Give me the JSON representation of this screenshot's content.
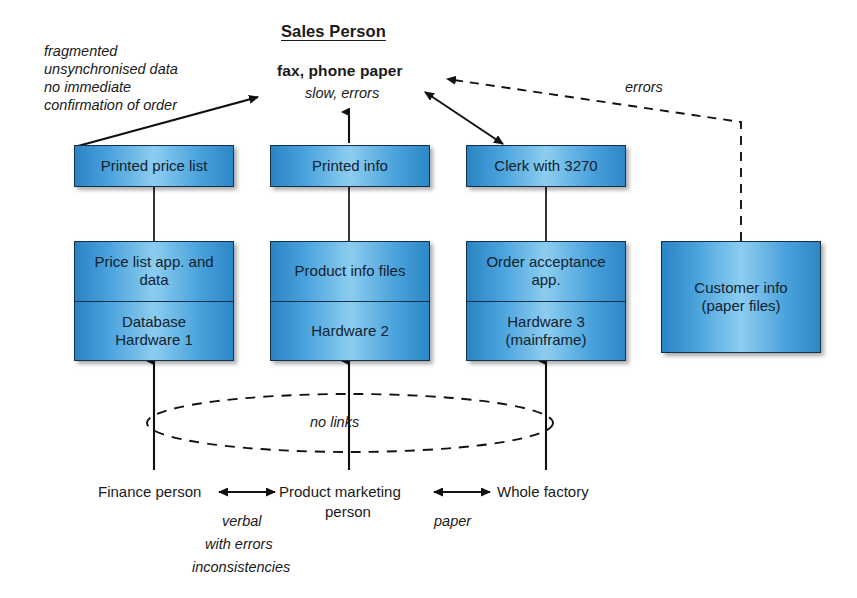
{
  "diagram": {
    "title": "Sales Person",
    "channel": {
      "headline": "fax, phone paper",
      "quality_note": "slow, errors"
    },
    "left_note": {
      "line1": "fragmented",
      "line2": "unsynchronised data",
      "line3": "no immediate",
      "line4": "confirmation of order"
    },
    "errors_label": "errors",
    "no_links_label": "no links",
    "columns": [
      {
        "output_box": "Printed price list",
        "system_top": "Price list app. and data",
        "system_bottom_line1": "Database",
        "system_bottom_line2": "Hardware 1",
        "actor": "Finance person"
      },
      {
        "output_box": "Printed info",
        "system_top": "Product info files",
        "system_bottom_line1": "Hardware 2",
        "system_bottom_line2": "",
        "actor": "Product marketing person"
      },
      {
        "output_box": "Clerk with 3270",
        "system_top": "Order acceptance app.",
        "system_bottom_line1": "Hardware 3",
        "system_bottom_line2": "(mainframe)",
        "actor": "Whole factory"
      }
    ],
    "standalone_box": {
      "line1": "Customer info",
      "line2": "(paper files)"
    },
    "actor_labels": {
      "finance_person": "Finance person",
      "product_marketing_1": "Product marketing",
      "product_marketing_2": "person",
      "whole_factory": "Whole factory"
    },
    "link_notes": {
      "verbal_line1": "verbal",
      "verbal_line2": "with errors",
      "verbal_line3": "inconsistencies",
      "paper": "paper"
    },
    "colors": {
      "box_fill_light": "#8ccdf0",
      "box_fill_dark": "#2a84c4",
      "box_border": "#15314a",
      "text": "#1a1a1a",
      "background": "#ffffff"
    }
  }
}
